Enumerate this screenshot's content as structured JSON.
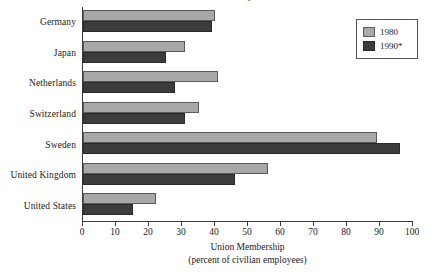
{
  "chart_data": {
    "type": "bar",
    "orientation": "horizontal",
    "title": "Union Membership",
    "subtitle": "",
    "xlabel_line1": "Union Membership",
    "xlabel_line2": "(percent of civilian employees)",
    "ylabel": "",
    "xlim": [
      0,
      100
    ],
    "xticks": [
      0,
      10,
      20,
      30,
      40,
      50,
      60,
      70,
      80,
      90,
      100
    ],
    "xtick_labels": [
      "0",
      "10",
      "20",
      "30",
      "40",
      "50",
      "60",
      "70",
      "80",
      "90",
      "100"
    ],
    "grid": false,
    "legend_position": "top-right",
    "categories": [
      "Germany",
      "Japan",
      "Netherlands",
      "Switzerland",
      "Sweden",
      "United Kingdom",
      "United States"
    ],
    "series": [
      {
        "name": "1980",
        "color": "#a8a8a8",
        "values": [
          40,
          31,
          41,
          35,
          89,
          56,
          22
        ]
      },
      {
        "name": "1990*",
        "color": "#3c3c3c",
        "values": [
          39,
          25,
          28,
          31,
          96,
          46,
          15
        ]
      }
    ]
  },
  "legend": {
    "entries": [
      {
        "label": "1980"
      },
      {
        "label": "1990*"
      }
    ]
  },
  "colors": {
    "series_1980": "#a8a8a8",
    "series_1990": "#3c3c3c",
    "axis": "#3a3a3a",
    "text": "#1a1a1a",
    "background": "#ffffff"
  }
}
